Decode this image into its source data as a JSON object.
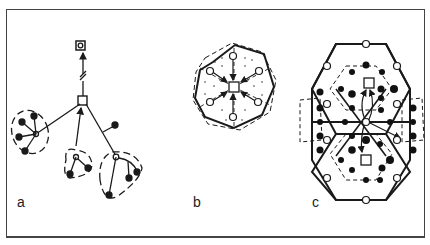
{
  "figure": {
    "panels": [
      {
        "id": "a",
        "label": "a",
        "description": "Tree network: central square node with arrow to boxed terminal node; three dashed-enclosed clusters of open and filled nodes"
      },
      {
        "id": "b",
        "label": "b",
        "description": "Rosette of hexagonal cells around central square with arrows inward from six open-circle nodes; dotted shading"
      },
      {
        "id": "c",
        "label": "c",
        "description": "Two stacked hexagons with open-circle vertices, filled-dot inner dashed hexagonal rings, two squares connected by curved arrows"
      }
    ],
    "colors": {
      "ink": "#1a1a1a",
      "frame": "#444444",
      "background": "#ffffff"
    }
  }
}
